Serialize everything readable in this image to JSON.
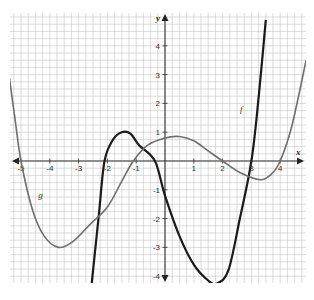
{
  "chart_data": {
    "type": "line",
    "title": "",
    "xlabel": "x",
    "ylabel": "y",
    "xlim": [
      -5.5,
      4.9
    ],
    "ylim": [
      -4.3,
      5.0
    ],
    "grid": true,
    "grid_minor_step": 0.25,
    "x_ticks": [
      -5,
      -4,
      -3,
      -2,
      -1,
      1,
      2,
      3,
      4
    ],
    "y_ticks": [
      -4,
      -3,
      -2,
      -1,
      1,
      2,
      3,
      4
    ],
    "series": [
      {
        "name": "f",
        "color": "#1a1a1a",
        "width": 2.2,
        "label_at": [
          2.6,
          1.7
        ],
        "points": [
          [
            -2.55,
            -4.3
          ],
          [
            -2.3,
            -1.9
          ],
          [
            -2.1,
            0
          ],
          [
            -1.8,
            0.75
          ],
          [
            -1.5,
            1.0
          ],
          [
            -1.2,
            0.95
          ],
          [
            -0.9,
            0.55
          ],
          [
            -0.35,
            0
          ],
          [
            0,
            -1.2
          ],
          [
            0.5,
            -2.6
          ],
          [
            1,
            -3.6
          ],
          [
            1.5,
            -4.15
          ],
          [
            1.8,
            -4.25
          ],
          [
            2.2,
            -3.8
          ],
          [
            2.6,
            -2.0
          ],
          [
            3,
            0
          ],
          [
            3.25,
            2.2
          ],
          [
            3.5,
            4.9
          ]
        ]
      },
      {
        "name": "g",
        "color": "#6e6e6e",
        "width": 1.6,
        "label_at": [
          -4.4,
          -1.3
        ],
        "points": [
          [
            -5.5,
            3.6
          ],
          [
            -5.2,
            1.4
          ],
          [
            -5,
            0
          ],
          [
            -4.6,
            -1.7
          ],
          [
            -4.2,
            -2.6
          ],
          [
            -3.7,
            -3.0
          ],
          [
            -3.2,
            -2.8
          ],
          [
            -2.6,
            -2.2
          ],
          [
            -2,
            -1.6
          ],
          [
            -1.5,
            -0.7
          ],
          [
            -1.1,
            0
          ],
          [
            -0.6,
            0.55
          ],
          [
            0,
            0.8
          ],
          [
            0.5,
            0.85
          ],
          [
            1,
            0.7
          ],
          [
            1.5,
            0.35
          ],
          [
            2,
            0
          ],
          [
            2.6,
            -0.4
          ],
          [
            3.3,
            -0.65
          ],
          [
            3.7,
            -0.45
          ],
          [
            4,
            0
          ],
          [
            4.4,
            1.2
          ],
          [
            4.9,
            3.5
          ]
        ]
      }
    ]
  },
  "labels": {
    "x_axis": "x",
    "y_axis": "y",
    "f": "f",
    "g": "g"
  }
}
